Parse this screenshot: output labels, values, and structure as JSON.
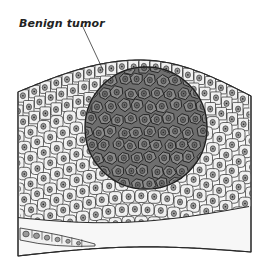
{
  "figure": {
    "type": "medical illustration"
  },
  "labels": [
    {
      "id": "benign-tumor",
      "text": "Benign tumor",
      "x": 19,
      "y": 17,
      "leader_from": [
        82,
        25
      ],
      "leader_to": [
        103,
        70
      ]
    }
  ],
  "colors": {
    "background": "#ffffff",
    "outline": "#2a2a2a",
    "normal_cell_fill": "#efefef",
    "normal_nucleus_fill": "#9a9a9a",
    "tumor_fill": "#7a7a7a",
    "tumor_cell_fill": "#8a8a8a",
    "tumor_nucleus_fill": "#6a6a6a",
    "connective_tissue": "#f6f6f6"
  },
  "geometry": {
    "tissue_block": {
      "left": 18,
      "right": 251,
      "top_left_y": 92,
      "top_peak_y": 60,
      "peak_x": 140,
      "top_right_y": 96,
      "bottom_left_y": 256,
      "bottom_right_y": 252
    },
    "tumor": {
      "cx": 146,
      "cy": 128,
      "r": 61
    },
    "basal_layer_bottom_y": 216,
    "gland_strip": {
      "x1": 20,
      "y1": 232,
      "x2": 95,
      "y2": 246
    }
  }
}
